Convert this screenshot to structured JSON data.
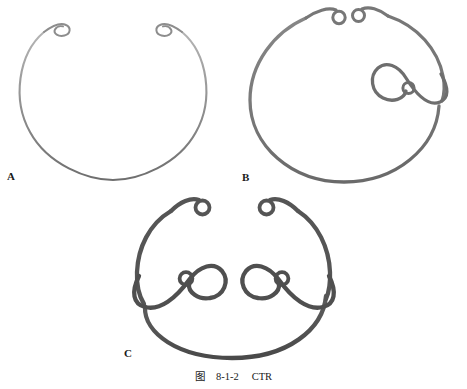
{
  "figure": {
    "caption_prefix": "图",
    "caption_number": "8-1-2",
    "caption_title": "CTR",
    "background_color": "#ffffff"
  },
  "panels": [
    {
      "id": "A",
      "label": "A",
      "name": "standard-capsular-tension-ring",
      "stroke_color": "#9a9a9a",
      "stroke_color_dark": "#6f6f6f",
      "stroke_width": 2.0,
      "eyelet_count": 2,
      "eyelet_positions": [
        "upper-left-terminal",
        "upper-right-terminal"
      ],
      "opening_direction": "top",
      "description": "Open ring with two small terminal eyelets at the superior gap"
    },
    {
      "id": "B",
      "label": "B",
      "name": "modified-capsular-tension-ring-one-fixation-hook",
      "stroke_color": "#7b7b7b",
      "stroke_color_dark": "#5e5e5e",
      "stroke_width": 3.2,
      "eyelet_count": 3,
      "eyelet_positions": [
        "upper-left-terminal",
        "upper-right-terminal",
        "right-lateral-fixation-hook"
      ],
      "opening_direction": "top",
      "description": "Open ring with two terminal eyelets plus one lateral scleral fixation hook on the right"
    },
    {
      "id": "C",
      "label": "C",
      "name": "modified-capsular-tension-ring-two-fixation-hooks",
      "stroke_color": "#575757",
      "stroke_color_dark": "#3f3f3f",
      "stroke_width": 4.2,
      "eyelet_count": 4,
      "eyelet_positions": [
        "upper-left-terminal",
        "upper-right-terminal",
        "left-lateral-fixation-hook",
        "right-lateral-fixation-hook"
      ],
      "opening_direction": "top",
      "description": "Open ring with two terminal eyelets plus two opposing lateral scleral fixation hooks"
    }
  ]
}
